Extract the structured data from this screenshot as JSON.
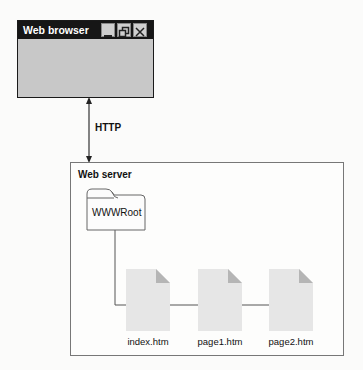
{
  "browser": {
    "title": "Web browser",
    "buttons": [
      "minimize",
      "restore",
      "close"
    ]
  },
  "connection": {
    "label": "HTTP"
  },
  "server": {
    "title": "Web server",
    "folder": {
      "label": "WWWRoot"
    },
    "files": [
      {
        "label": "index.htm"
      },
      {
        "label": "page1.htm"
      },
      {
        "label": "page2.htm"
      }
    ]
  },
  "colors": {
    "titlebar": "#161616",
    "window_body": "#c8c8c8",
    "file_fill": "#e6e6e6",
    "file_fold": "#b5b5b5",
    "line": "#555555"
  }
}
